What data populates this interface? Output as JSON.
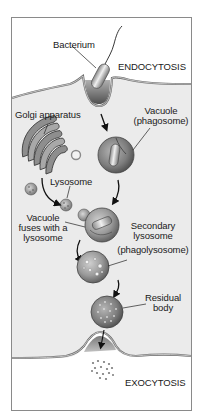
{
  "diagram": {
    "colors": {
      "background": "#ffffff",
      "frame": "#8a8a8a",
      "cytoplasm": "#ebebeb",
      "membrane_outer": "#6e6e6e",
      "membrane_inner": "#bdbdbd",
      "organelle_dark": "#5a5a5a",
      "organelle_mid": "#8c8c8c",
      "organelle_light": "#d0d0d0",
      "text": "#1a1a1a"
    },
    "labels": {
      "bacterium": "Bacterium",
      "endocytosis": "ENDOCYTOSIS",
      "golgi": "Golgi apparatus",
      "vacuole_line1": "Vacuole",
      "vacuole_line2": "(phagosome)",
      "lysosome": "Lysosome",
      "fuses_line1": "Vacuole",
      "fuses_line2": "fuses with a",
      "fuses_line3": "lysosome",
      "secondary_line1": "Secondary",
      "secondary_line2": "lysosome",
      "secondary_line3": "(phagolysosome)",
      "residual_line1": "Residual",
      "residual_line2": "body",
      "exocytosis": "EXOCYTOSIS"
    },
    "stages": [
      "Bacterium engulfed by endocytosis",
      "Vacuole (phagosome) forms",
      "Lysosome from Golgi apparatus",
      "Vacuole fuses with a lysosome",
      "Secondary lysosome (phagolysosome)",
      "Residual body",
      "Exocytosis"
    ]
  }
}
